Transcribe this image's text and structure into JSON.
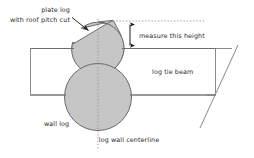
{
  "diagram": {
    "background_color": "#ffffff",
    "line_color": "#6e6e6e",
    "dark_line_color": "#3a3a3a",
    "log_fill_color": "#c6c6c6",
    "log_stroke_color": "#6b6b6b",
    "beam_fill_color": "#ffffff",
    "beam_stroke_color": "#8a8a8a",
    "text_color": "#2b2b2b",
    "labels": {
      "plate_log_line1": "plate log",
      "plate_log_line2": "with roof pitch cut",
      "measure_height": "measure this height",
      "log_tie_beam": "log tie beam",
      "wall_log": "wall log",
      "log_wall_centerline": "log wall centerline"
    },
    "annotations": {
      "leader_arrow": "leader-arrow-to-plate-log",
      "dimension_arrow": "vertical-double-headed-dimension-arrow",
      "centerline_style": "dotted-vertical",
      "top_reference_line_style": "dotted-horizontal"
    }
  }
}
